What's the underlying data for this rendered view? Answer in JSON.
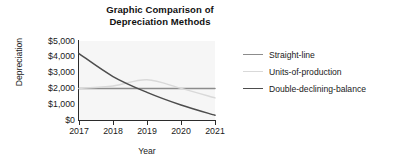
{
  "chart_data": {
    "type": "line",
    "title": "Graphic Comparison of Depreciation Methods",
    "title_lines": [
      "Graphic Comparison of",
      "Depreciation Methods"
    ],
    "xlabel": "Year",
    "ylabel": "Depreciation",
    "categories": [
      "2017",
      "2018",
      "2019",
      "2020",
      "2021"
    ],
    "x": [
      2017,
      2018,
      2019,
      2020,
      2021
    ],
    "ylim": [
      0,
      5000
    ],
    "xlim": [
      2017,
      2021
    ],
    "grid": false,
    "legend_position": "right",
    "ytick_labels": [
      "$5,000",
      "$4,000",
      "$3,000",
      "$2,000",
      "$1,000",
      "$0"
    ],
    "ytick_values": [
      5000,
      4000,
      3000,
      2000,
      1000,
      0
    ],
    "series": [
      {
        "name": "Straight-line",
        "color": "#8c8c8c",
        "values": [
          2000,
          2000,
          2000,
          2000,
          2000
        ]
      },
      {
        "name": "Units-of-production",
        "color": "#d9d9d9",
        "values": [
          2000,
          2150,
          2550,
          2000,
          1400
        ]
      },
      {
        "name": "Double-declining-balance",
        "color": "#4d4d4d",
        "values": [
          4200,
          2750,
          1750,
          950,
          300
        ]
      }
    ]
  },
  "legend": {
    "items": [
      {
        "label": "Straight-line"
      },
      {
        "label": "Units-of-production"
      },
      {
        "label": "Double-declining-balance"
      }
    ]
  },
  "colors": {
    "plot_background": "#f6f6f6",
    "axis": "#2b2b2b",
    "text": "#1a1a1a"
  }
}
